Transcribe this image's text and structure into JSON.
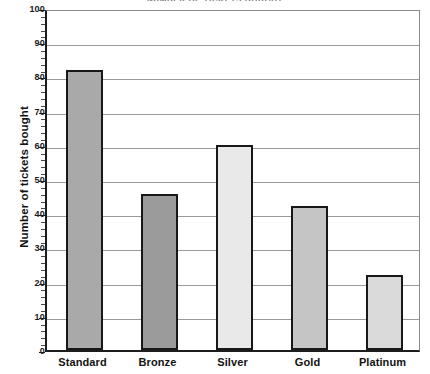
{
  "chart_data": {
    "type": "bar",
    "title": "NUMBER OF TICKETS BOUGHT",
    "xlabel": "",
    "ylabel": "Number of tickets bought",
    "categories": [
      "Standard",
      "Bronze",
      "Silver",
      "Gold",
      "Platinum"
    ],
    "values": [
      82,
      45.5,
      60,
      42,
      22
    ],
    "ylim": [
      0,
      100
    ],
    "ytick_step": 10,
    "ytick_labels": [
      "0",
      "10",
      "20",
      "30",
      "40",
      "50",
      "60",
      "70",
      "80",
      "90",
      "100"
    ],
    "yminor_step": 2,
    "grid": true,
    "legend": false,
    "bar_colors": [
      "#a9a9a9",
      "#9b9b9b",
      "#e9e9e9",
      "#c5c5c5",
      "#dadada"
    ],
    "bar_border_color": "#181818",
    "gridline_color": "#9a9a9a",
    "axis_color": "#1d1d1d",
    "background_color": "#ffffff"
  }
}
